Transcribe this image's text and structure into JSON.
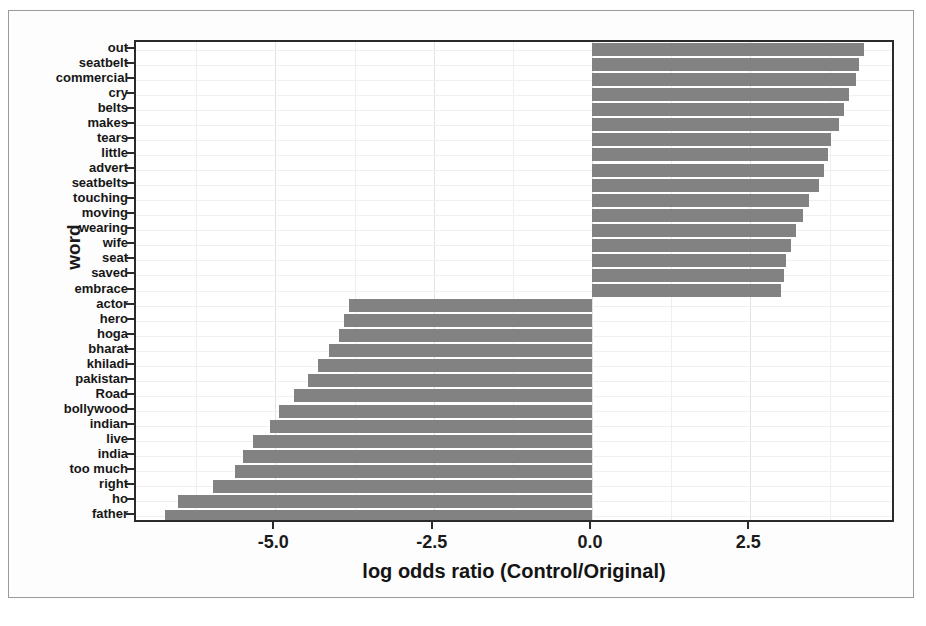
{
  "chart_data": {
    "type": "bar",
    "orientation": "horizontal",
    "title": "",
    "xlabel": "log odds ratio (Control/Original)",
    "ylabel": "word",
    "xlim": [
      -7.2,
      4.8
    ],
    "ylim": [
      0,
      28
    ],
    "grid": true,
    "legend": "none",
    "bar_color": "#828282",
    "xticks": [
      "-5.0",
      "-2.5",
      "0.0",
      "2.5"
    ],
    "xtick_values": [
      -5.0,
      -2.5,
      0.0,
      2.5
    ],
    "categories": [
      "out",
      "seatbelt",
      "commercial",
      "cry",
      "belts",
      "makes",
      "tears",
      "little",
      "advert",
      "seatbelts",
      "touching",
      "moving",
      "wearing",
      "wife",
      "seat",
      "saved",
      "embrace",
      "actor",
      "hero",
      "hoga",
      "bharat",
      "khiladi",
      "pakistan",
      "Road",
      "bollywood",
      "indian",
      "live",
      "india",
      "too much",
      "right",
      "ho",
      "father"
    ],
    "values": [
      4.29,
      4.22,
      4.17,
      4.05,
      3.98,
      3.9,
      3.78,
      3.73,
      3.67,
      3.59,
      3.43,
      3.33,
      3.22,
      3.14,
      3.06,
      3.03,
      2.98,
      -3.84,
      -3.92,
      -4.0,
      -4.16,
      -4.32,
      -4.48,
      -4.71,
      -4.95,
      -5.08,
      -5.35,
      -5.51,
      -5.63,
      -5.98,
      -6.54,
      -6.75
    ]
  }
}
